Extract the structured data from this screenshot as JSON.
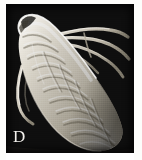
{
  "figure": {
    "domain": "natural-image",
    "kind": "scanning-electron-micrograph",
    "panel_letter": "D",
    "background_color": "#080808",
    "page_color": "#ffffff",
    "specimen_color": "#e8e4db",
    "plate": {
      "x": 6,
      "y": 4,
      "width": 128,
      "height": 149
    }
  },
  "specimen": {
    "description": "elongate teardrop-shaped mite, anterior at upper-left, posterior rounded at lower-right",
    "body": {
      "fill_light": "#f3efe6",
      "fill_mid": "#cec8ba",
      "fill_shadow": "#6a6459",
      "outline_highlight": "#ffffff",
      "axis_degrees": 52,
      "annuli_count": 11
    },
    "appendages": [
      {
        "name": "leg-upper-right-1",
        "color": "#d9d3c6"
      },
      {
        "name": "leg-upper-right-2",
        "color": "#cfc9bc"
      },
      {
        "name": "leg-upper-right-3",
        "color": "#c4bdae"
      },
      {
        "name": "leg-upper-right-4",
        "color": "#b8b1a2"
      },
      {
        "name": "seta-lower-left",
        "color": "#ded8cb"
      }
    ]
  },
  "label": {
    "text": "D",
    "color": "#f2f0ec",
    "position": {
      "x": 7,
      "y": 122
    }
  }
}
